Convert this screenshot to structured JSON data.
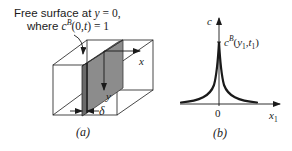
{
  "panel_a": {
    "caption": "(a)",
    "annotation_line1_prefix": "Free surface at ",
    "annotation_line1_var": "y",
    "annotation_line1_suffix": " = 0,",
    "annotation_line2_prefix": "where ",
    "annotation_line2_c": "c",
    "annotation_line2_sup": "B",
    "annotation_line2_args": "(0,",
    "annotation_line2_t": "t",
    "annotation_line2_end": ") = 1",
    "axis_x_label": "x",
    "axis_y_label": "y",
    "thickness_label": "δ"
  },
  "panel_b": {
    "caption": "(b)",
    "y_axis_label": "c",
    "x_axis_label": "x",
    "x_axis_sub": "1",
    "origin_label": "0",
    "peak_c": "c",
    "peak_sup": "B",
    "peak_open": "(",
    "peak_y": "y",
    "peak_y_sub": "1",
    "peak_comma": ",",
    "peak_t": "t",
    "peak_t_sub": "1",
    "peak_close": ")"
  },
  "colors": {
    "line": "#1a1a1a",
    "plate_fill": "#8c8c8c",
    "plate_edge": "#5a5a5a",
    "curve": "#1a1a1a"
  }
}
